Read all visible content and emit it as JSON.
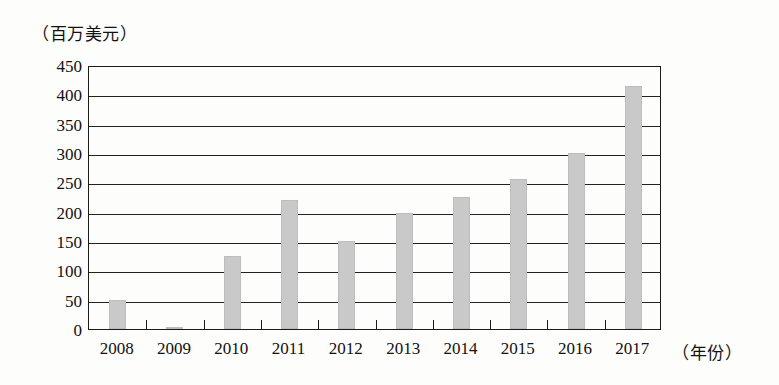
{
  "chart_data": {
    "type": "bar",
    "title": "",
    "ylabel": "（百万美元）",
    "xlabel": "（年份）",
    "categories": [
      "2008",
      "2009",
      "2010",
      "2011",
      "2012",
      "2013",
      "2014",
      "2015",
      "2016",
      "2017"
    ],
    "values": [
      50,
      2,
      125,
      220,
      150,
      197,
      225,
      255,
      300,
      415
    ],
    "ylim": [
      0,
      450
    ],
    "ytick_labels": [
      "0",
      "50",
      "100",
      "150",
      "200",
      "250",
      "300",
      "350",
      "400",
      "450"
    ],
    "ytick_values": [
      0,
      50,
      100,
      150,
      200,
      250,
      300,
      350,
      400,
      450
    ],
    "grid": "horizontal",
    "legend": "none",
    "bar_color": "#c9c9c9",
    "axis_color": "#1b1b1b",
    "background": "#fdfdfb"
  }
}
